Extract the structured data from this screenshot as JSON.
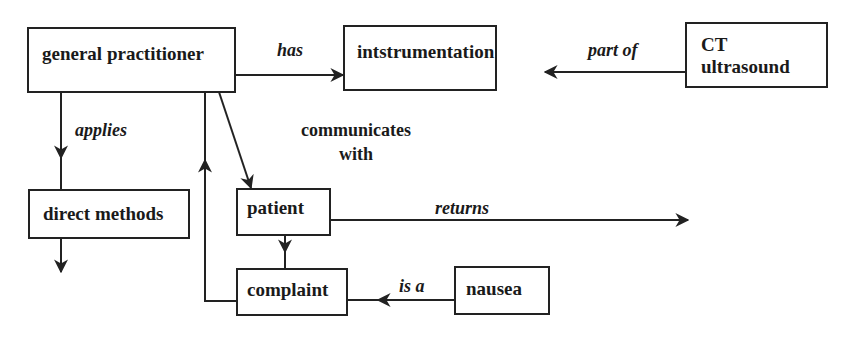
{
  "diagram": {
    "type": "concept-graph",
    "nodes": {
      "general_practitioner": {
        "label": "general practitioner"
      },
      "instrumentation": {
        "label": "intstrumentation"
      },
      "ct_ultrasound": {
        "line1": "CT",
        "line2": "ultrasound"
      },
      "direct_methods": {
        "label": "direct methods"
      },
      "patient": {
        "label": "patient"
      },
      "complaint": {
        "label": "complaint"
      },
      "nausea": {
        "label": "nausea"
      }
    },
    "edges": {
      "has": {
        "label": "has",
        "from": "general practitioner",
        "to": "intstrumentation"
      },
      "part_of": {
        "label": "part of",
        "from": "CT ultrasound",
        "to": "intstrumentation"
      },
      "applies": {
        "label": "applies",
        "from": "general practitioner",
        "to": "direct methods"
      },
      "communicates_with": {
        "line1": "communicates",
        "line2": "with",
        "from": "general practitioner",
        "to": "patient"
      },
      "returns": {
        "label": "returns",
        "from": "patient",
        "to": ""
      },
      "patient_complaint": {
        "label": "",
        "from": "patient",
        "to": "complaint"
      },
      "complaint_gp": {
        "label": "",
        "from": "complaint",
        "to": "general practitioner"
      },
      "is_a": {
        "label": "is a",
        "from": "nausea",
        "to": "complaint"
      },
      "direct_methods_out": {
        "label": "",
        "from": "direct methods",
        "to": ""
      }
    }
  }
}
